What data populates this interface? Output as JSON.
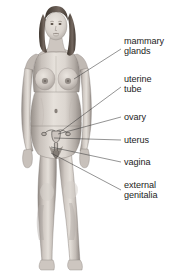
{
  "diagram": {
    "background_color": "#ffffff",
    "text_color": "#1c1c1c",
    "leader_line_color": "#3a3a3a",
    "skin_tone": "#c9c2bb",
    "hair_color": "#4a4038",
    "organ_outline_color": "#5d5a57"
  },
  "labels": [
    {
      "id": "mammary-glands",
      "text": "mammary\nglands",
      "x": 124,
      "y": 41,
      "leader_from": [
        122,
        49
      ],
      "leader_to": [
        74,
        79
      ]
    },
    {
      "id": "uterine-tube",
      "text": "uterine\ntube",
      "x": 124,
      "y": 79,
      "leader_from": [
        122,
        87
      ],
      "leader_to": [
        60,
        133
      ]
    },
    {
      "id": "ovary",
      "text": "ovary",
      "x": 124,
      "y": 113,
      "leader_from": [
        122,
        117
      ],
      "leader_to": [
        57,
        134
      ]
    },
    {
      "id": "uterus",
      "text": "uterus",
      "x": 124,
      "y": 136,
      "leader_from": [
        122,
        140
      ],
      "leader_to": [
        53,
        139
      ]
    },
    {
      "id": "vagina",
      "text": "vagina",
      "x": 124,
      "y": 158,
      "leader_from": [
        122,
        162
      ],
      "leader_to": [
        50,
        147
      ]
    },
    {
      "id": "external-genitalia",
      "text": "external\ngenitalia",
      "x": 124,
      "y": 185,
      "leader_from": [
        122,
        190
      ],
      "leader_to": [
        50,
        152
      ]
    }
  ]
}
